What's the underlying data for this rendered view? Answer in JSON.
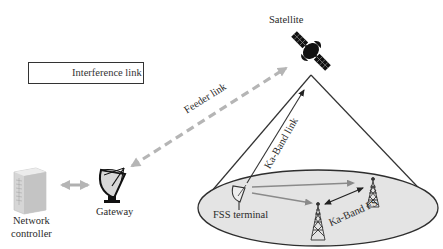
{
  "diagram": {
    "type": "satellite-communication-interference-scenario",
    "legend": {
      "items": [
        {
          "symbol": "grey-arrow",
          "label": "Interference link",
          "color": "#8a8a8a"
        }
      ]
    },
    "nodes": {
      "satellite": {
        "label": "Satellite",
        "icon": "satellite-icon"
      },
      "gateway": {
        "label": "Gateway",
        "icon": "satellite-dish-icon"
      },
      "network_controller": {
        "label_line1": "Network",
        "label_line2": "controller",
        "icon": "server-tower-icon"
      },
      "fss_terminal": {
        "label": "FSS terminal",
        "icon": "small-dish-icon"
      },
      "fs_tower_1": {
        "icon": "radio-tower-icon"
      },
      "fs_tower_2": {
        "icon": "radio-tower-icon"
      }
    },
    "links": {
      "feeder": {
        "label": "Feeder link",
        "style": "dashed",
        "color": "#b5b5b5"
      },
      "ka_band": {
        "label": "Ka-Band link",
        "style": "solid",
        "color": "#333333"
      },
      "ka_band_fs": {
        "label": "Ka-Band FS",
        "style": "solid-double-arrow",
        "color": "#222222"
      },
      "controller_gateway": {
        "style": "double-arrow",
        "color": "#b0b0b0"
      },
      "interference": {
        "color": "#8a8a8a"
      }
    },
    "coverage": {
      "fill": "#e6e6e6",
      "stroke": "#333333"
    }
  }
}
